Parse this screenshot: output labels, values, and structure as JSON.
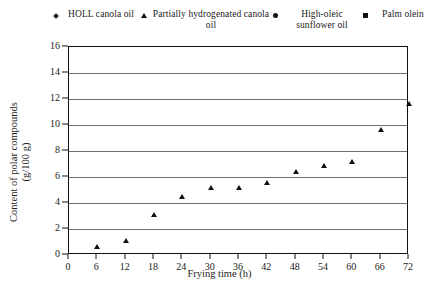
{
  "chart_data": {
    "type": "scatter",
    "title": "",
    "xlabel": "Frying time (h)",
    "ylabel": "Content of polar compounds (g/100 g)",
    "ylabel_line1": "Content of polar compounds",
    "ylabel_line2": "(g/100 g)",
    "xlim": [
      0,
      72
    ],
    "ylim": [
      0,
      16
    ],
    "xticks": [
      0,
      6,
      12,
      18,
      24,
      30,
      36,
      42,
      48,
      54,
      60,
      66,
      72
    ],
    "yticks": [
      0,
      2,
      4,
      6,
      8,
      10,
      12,
      14,
      16
    ],
    "grid": "horizontal",
    "legend_position": "top",
    "x": [
      6,
      12,
      18,
      24,
      30,
      36,
      42,
      48,
      54,
      60,
      66,
      72
    ],
    "series": [
      {
        "name": "HOLL canola oil",
        "marker": "diamond",
        "color": "#111111",
        "values": [
          1.2,
          3.6,
          4.6,
          5.4,
          5.9,
          5.9,
          6.8,
          7.4,
          7.6,
          8.1,
          9.5,
          11.2
        ]
      },
      {
        "name": "Partially hydrogenated canola oil",
        "marker": "triangle",
        "color": "#111111",
        "values": [
          1.5,
          1.9,
          3.9,
          5.3,
          6.0,
          6.0,
          6.4,
          7.2,
          7.7,
          8.0,
          10.5,
          12.5
        ]
      },
      {
        "name": "High-oleic sunflower oil",
        "marker": "circle",
        "color": "#111111",
        "values": [
          3.0,
          3.8,
          4.9,
          5.7,
          6.1,
          6.6,
          6.9,
          7.5,
          8.3,
          8.4,
          10.1,
          11.8
        ]
      },
      {
        "name": "Palm olein",
        "marker": "square",
        "color": "#111111",
        "values": [
          6.8,
          7.3,
          8.2,
          8.3,
          8.9,
          9.1,
          10.7,
          11.8,
          12.2,
          12.8,
          14.2,
          14.5
        ]
      }
    ]
  },
  "legend": {
    "items": [
      {
        "label": "HOLL canola oil",
        "marker": "diamond-marker"
      },
      {
        "label": "Partially hydrogenated canola oil",
        "marker": "triangle-marker"
      },
      {
        "label": "High-oleic sunflower oil",
        "marker": "circle-marker"
      },
      {
        "label": "Palm olein",
        "marker": "square-marker"
      }
    ]
  }
}
